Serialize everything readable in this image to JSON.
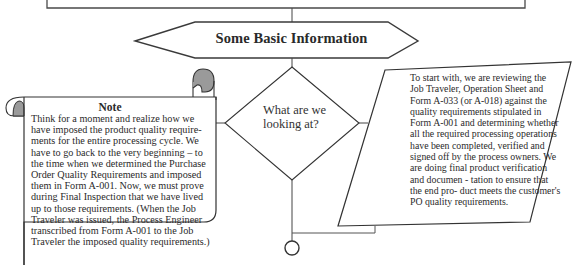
{
  "diagram": {
    "header_shape": {
      "label": "Some Basic Information"
    },
    "note": {
      "title": "Note",
      "body": "Think for a moment and realize how we have imposed the product quality require- ments for the entire processing cycle. We have to go back to the very beginning – to the time when we determined the Purchase Order Quality Requirements and imposed them in Form A-001. Now, we must prove during Final Inspection that we have lived up to those requirements. (When the Job Traveler was issued, the Process Engineer transcribed from Form A-001 to the Job Traveler the imposed quality requirements.)"
    },
    "decision": {
      "label": "What are we looking at?"
    },
    "description": {
      "body": "To start with, we are reviewing the Job Traveler, Operation Sheet and Form A-033 (or A-018) against the quality requirements stipulated in Form A-001 and determining whether all the required processing operations have been completed, verified and signed off by the process owners. We are doing final product verification and documen - tation to ensure that the end pro- duct meets the customer's PO quality requirements."
    },
    "colors": {
      "stroke": "#3a3a3a",
      "scroll_curl_fill": "#9a9a9a",
      "background": "#ffffff"
    }
  }
}
